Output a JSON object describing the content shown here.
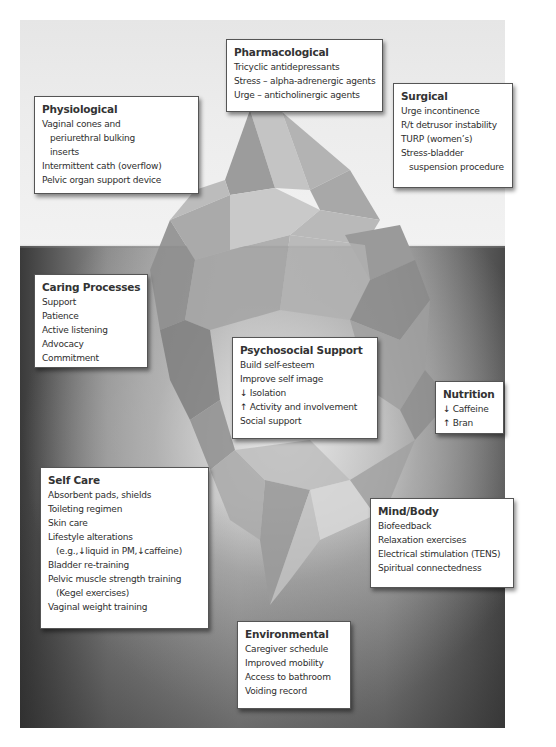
{
  "diagram": {
    "type": "iceberg",
    "above_water_label": "",
    "colors": {
      "sky": "#ececec",
      "sea_dark": "#3a3a3a",
      "sea_light": "#bdbdbd",
      "iceberg": "#a9a9a9",
      "box_fill": "#ffffff",
      "box_border": "#555555",
      "text": "#2e2e2e"
    }
  },
  "boxes": {
    "pharmacological": {
      "title": "Pharmacological",
      "items": [
        "Tricyclic antidepressants",
        "Stress – alpha-adrenergic agents",
        "Urge – anticholinergic agents"
      ]
    },
    "physiological": {
      "title": "Physiological",
      "items": [
        "Vaginal cones and",
        "periurethral bulking",
        "inserts",
        "Intermittent cath (overflow)",
        "Pelvic organ support device"
      ]
    },
    "surgical": {
      "title": "Surgical",
      "items": [
        "Urge incontinence",
        "R/t detrusor instability",
        "TURP (women’s)",
        "Stress-bladder",
        "suspension procedure"
      ]
    },
    "caring_processes": {
      "title": "Caring Processes",
      "items": [
        "Support",
        "Patience",
        "Active listening",
        "Advocacy",
        "Commitment"
      ]
    },
    "psychosocial_support": {
      "title": "Psychosocial Support",
      "items": [
        "Build self-esteem",
        "Improve self image",
        "Isolation",
        "Activity and involvement",
        "Social support"
      ],
      "arrows": {
        "down": "↓",
        "up": "↑"
      }
    },
    "nutrition": {
      "title": "Nutrition",
      "items": [
        "Caffeine",
        "Bran"
      ],
      "arrows": {
        "down": "↓",
        "up": "↑"
      }
    },
    "self_care": {
      "title": "Self Care",
      "items": [
        "Absorbent pads, shields",
        "Toileting regimen",
        "Skin care",
        "Lifestyle alterations",
        "(e.g.,",
        "liquid in PM,",
        "caffeine)",
        "Bladder re-training",
        "Pelvic muscle strength training",
        "(Kegel exercises)",
        "Vaginal weight training"
      ],
      "arrows": {
        "down": "↓"
      }
    },
    "mind_body": {
      "title": "Mind/Body",
      "items": [
        "Biofeedback",
        "Relaxation exercises",
        "Electrical stimulation (TENS)",
        "Spiritual connectedness"
      ]
    },
    "environmental": {
      "title": "Environmental",
      "items": [
        "Caregiver schedule",
        "Improved mobility",
        "Access to bathroom",
        "Voiding record"
      ]
    }
  }
}
